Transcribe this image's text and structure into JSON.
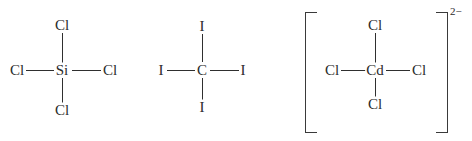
{
  "figure": {
    "background_color": "#ffffff",
    "ink_color": "#2b2b2b",
    "bond_color": "#2f2f2f",
    "width": 472,
    "height": 141
  },
  "structures": [
    {
      "id": "silicon-tetrachloride",
      "formula": "SiCl4",
      "center": {
        "label": "Si",
        "x": 62,
        "y": 70
      },
      "charge": "",
      "brackets": false,
      "substituents": [
        {
          "position": "top",
          "label": "Cl",
          "x": 62,
          "y": 25
        },
        {
          "position": "left",
          "label": "Cl",
          "x": 17,
          "y": 70
        },
        {
          "position": "right",
          "label": "Cl",
          "x": 110,
          "y": 70
        },
        {
          "position": "bottom",
          "label": "Cl",
          "x": 62,
          "y": 110
        }
      ]
    },
    {
      "id": "carbon-tetraiodide",
      "formula": "CI4",
      "center": {
        "label": "C",
        "x": 202,
        "y": 70
      },
      "charge": "",
      "brackets": false,
      "substituents": [
        {
          "position": "top",
          "label": "I",
          "x": 202,
          "y": 26
        },
        {
          "position": "left",
          "label": "I",
          "x": 161,
          "y": 70
        },
        {
          "position": "right",
          "label": "I",
          "x": 243,
          "y": 70
        },
        {
          "position": "bottom",
          "label": "I",
          "x": 202,
          "y": 107
        }
      ]
    },
    {
      "id": "tetrachlorocadmate",
      "formula": "CdCl4",
      "center": {
        "label": "Cd",
        "x": 375,
        "y": 70
      },
      "charge": "2−",
      "brackets": true,
      "bracket_left_x": 305,
      "bracket_right_x": 447,
      "bracket_top_y": 12,
      "bracket_bottom_y": 133,
      "substituents": [
        {
          "position": "top",
          "label": "Cl",
          "x": 375,
          "y": 25
        },
        {
          "position": "left",
          "label": "Cl",
          "x": 332,
          "y": 70
        },
        {
          "position": "right",
          "label": "Cl",
          "x": 419,
          "y": 70
        },
        {
          "position": "bottom",
          "label": "Cl",
          "x": 375,
          "y": 104
        }
      ]
    }
  ]
}
